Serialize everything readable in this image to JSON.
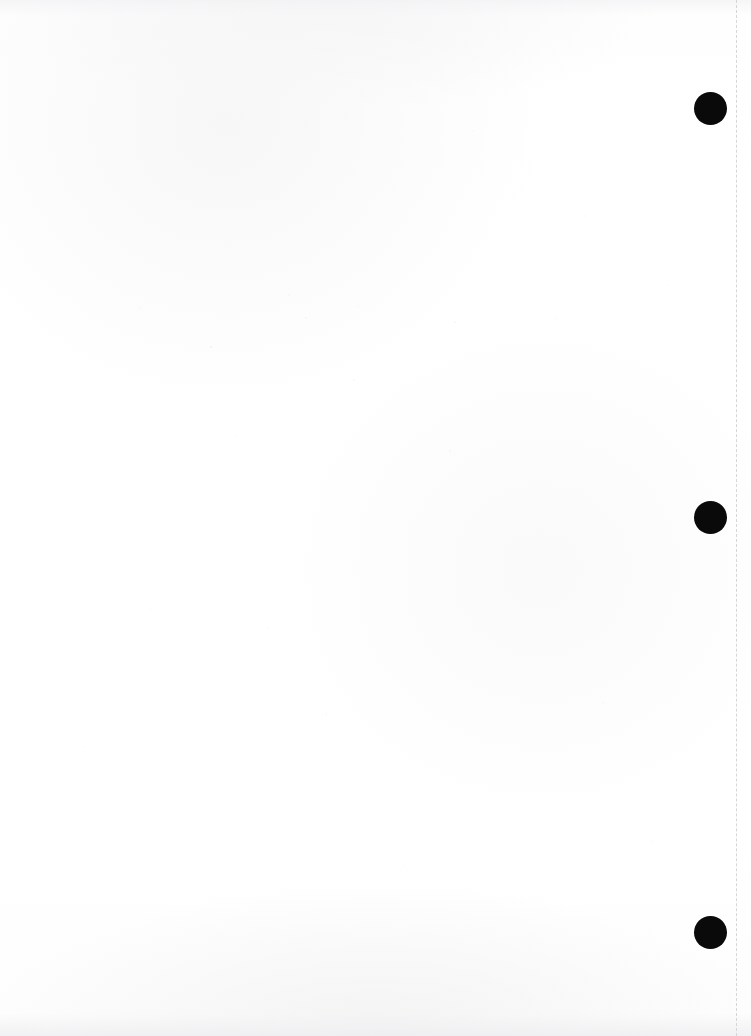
{
  "page": {
    "label": "Scanned blank page",
    "width": 751,
    "height": 1036,
    "background_color": "#ffffff",
    "paper_tone_color": "#fdfdfd"
  },
  "perforation_line": {
    "label": "Dashed vertical perforation guide",
    "x": 736,
    "color": "#d6d6da",
    "dash_length": 5,
    "gap_length": 4,
    "thickness": 1
  },
  "registration_dots": {
    "label": "Black registration marks",
    "color": "#0a0a0a",
    "diameter": 33,
    "center_x": 710,
    "items": [
      {
        "name": "registration-dot-top",
        "center_y": 108
      },
      {
        "name": "registration-dot-middle",
        "center_y": 517
      },
      {
        "name": "registration-dot-bottom",
        "center_y": 932
      }
    ]
  },
  "content": {
    "body_text": "",
    "note": ""
  }
}
